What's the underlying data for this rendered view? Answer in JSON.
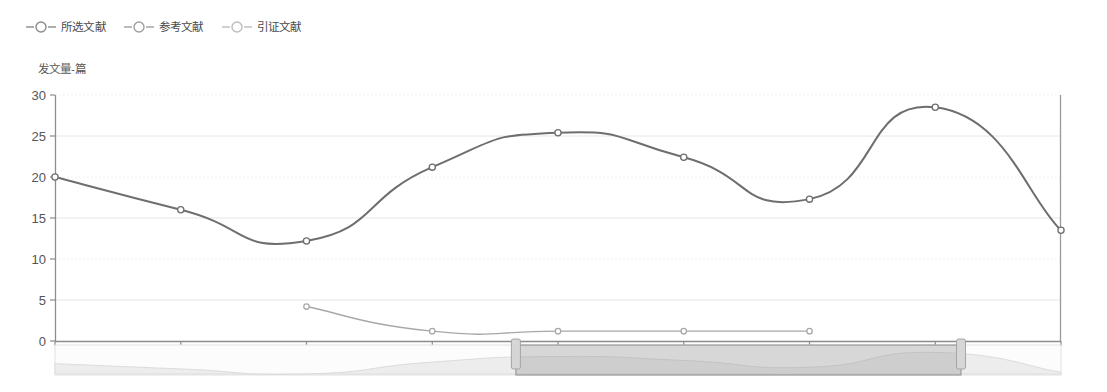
{
  "legend": {
    "items": [
      {
        "name": "legend-item-selected",
        "label": "所选文献",
        "color": "#6e6e6e"
      },
      {
        "name": "legend-item-reference",
        "label": "参考文献",
        "color": "#9a9a9a"
      },
      {
        "name": "legend-item-citation",
        "label": "引证文献",
        "color": "#c0c0c0"
      }
    ]
  },
  "axis": {
    "y_name": "发文量-篇",
    "y_ticks": [
      "0",
      "5",
      "10",
      "15",
      "20",
      "25",
      "30"
    ],
    "x_ticks": [
      "2015",
      "2016",
      "2017",
      "2018",
      "2019",
      "2020",
      "2021",
      "2022",
      "2023"
    ]
  },
  "datazoom": {
    "start_label": "2018",
    "end_label": "2022",
    "start_percent": 58,
    "end_percent": 114
  },
  "chart_data": {
    "type": "line",
    "title": "",
    "xlabel": "",
    "ylabel": "发文量-篇",
    "ylim": [
      0,
      30
    ],
    "grid": true,
    "legend_position": "top-left",
    "categories": [
      "2015",
      "2016",
      "2017",
      "2018",
      "2019",
      "2020",
      "2021",
      "2022",
      "2023"
    ],
    "series": [
      {
        "name": "所选文献",
        "color": "#6e6e6e",
        "smooth": true,
        "values": [
          20,
          16,
          12.2,
          21.2,
          25.4,
          22.4,
          17.3,
          28.5,
          13.5
        ]
      },
      {
        "name": "参考文献",
        "color": "#a8a8a8",
        "smooth": true,
        "values": [
          null,
          null,
          4.2,
          1.2,
          1.2,
          1.2,
          1.2,
          null,
          null
        ]
      },
      {
        "name": "引证文献",
        "color": "#c8c8c8",
        "smooth": true,
        "values": [
          null,
          null,
          null,
          null,
          null,
          null,
          null,
          null,
          null
        ]
      }
    ]
  }
}
